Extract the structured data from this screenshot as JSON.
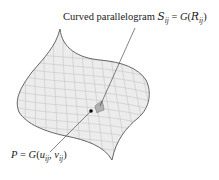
{
  "diagram": {
    "labels": {
      "top": {
        "prefix": "Curved parallelogram ",
        "S": "S",
        "S_sub": "ij",
        "equals": " = ",
        "G": "G",
        "open": "(",
        "R": "R",
        "R_sub": "ij",
        "close": ")"
      },
      "bottom": {
        "P": "P",
        "equals": " = ",
        "G": "G",
        "open": "(",
        "u": "u",
        "u_sub": "ij",
        "comma": ", ",
        "v": "v",
        "v_sub": "ij",
        "close": ")"
      }
    },
    "colors": {
      "surface_fill": "#ececec",
      "grid_lines": "#c8c8c8",
      "outline": "#555555",
      "patch_fill": "#b4b4b4",
      "point": "#000000",
      "leader_line": "#333333"
    }
  }
}
